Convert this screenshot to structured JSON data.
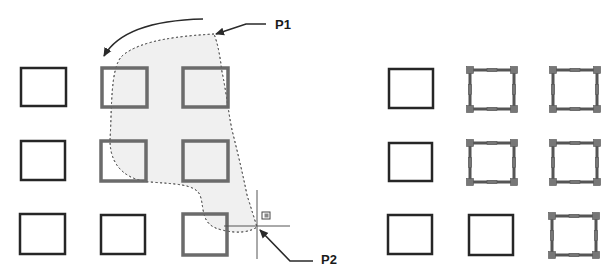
{
  "diagram": {
    "labels": {
      "p1": "P1",
      "p2": "P2"
    },
    "colors": {
      "object_stroke": "#262626",
      "selected_stroke": "#6b6b6b",
      "lasso_fill": "#f0f0f0",
      "lasso_stroke": "#555555",
      "grip_fill": "#777777",
      "arrow": "#2a2a2a"
    },
    "left_panel": {
      "description": "Lasso drawn from P1 to P2 counter-clockwise",
      "objects": [
        {
          "row": 1,
          "col": 1,
          "x": 21,
          "y": 68,
          "w": 45,
          "h": 38,
          "highlighted": false
        },
        {
          "row": 1,
          "col": 2,
          "x": 102,
          "y": 68,
          "w": 45,
          "h": 39,
          "highlighted": true
        },
        {
          "row": 1,
          "col": 3,
          "x": 183,
          "y": 68,
          "w": 45,
          "h": 39,
          "highlighted": true
        },
        {
          "row": 2,
          "col": 1,
          "x": 21,
          "y": 141,
          "w": 44,
          "h": 39,
          "highlighted": false
        },
        {
          "row": 2,
          "col": 2,
          "x": 101,
          "y": 141,
          "w": 45,
          "h": 40,
          "highlighted": true
        },
        {
          "row": 2,
          "col": 3,
          "x": 183,
          "y": 141,
          "w": 45,
          "h": 40,
          "highlighted": true
        },
        {
          "row": 3,
          "col": 1,
          "x": 20,
          "y": 214,
          "w": 45,
          "h": 40,
          "highlighted": false
        },
        {
          "row": 3,
          "col": 2,
          "x": 101,
          "y": 215,
          "w": 44,
          "h": 39,
          "highlighted": false
        },
        {
          "row": 3,
          "col": 3,
          "x": 183,
          "y": 214,
          "w": 44,
          "h": 41,
          "highlighted": true
        }
      ]
    },
    "right_panel": {
      "description": "Objects selected by lasso shown with grips",
      "objects": [
        {
          "row": 1,
          "col": 1,
          "x": 389,
          "y": 69,
          "w": 44,
          "h": 39,
          "selected": false
        },
        {
          "row": 1,
          "col": 2,
          "x": 470,
          "y": 70,
          "w": 44,
          "h": 39,
          "selected": true
        },
        {
          "row": 1,
          "col": 3,
          "x": 553,
          "y": 70,
          "w": 44,
          "h": 39,
          "selected": true
        },
        {
          "row": 2,
          "col": 1,
          "x": 389,
          "y": 143,
          "w": 43,
          "h": 38,
          "selected": false
        },
        {
          "row": 2,
          "col": 2,
          "x": 470,
          "y": 143,
          "w": 44,
          "h": 39,
          "selected": true
        },
        {
          "row": 2,
          "col": 3,
          "x": 553,
          "y": 143,
          "w": 44,
          "h": 39,
          "selected": true
        },
        {
          "row": 3,
          "col": 1,
          "x": 388,
          "y": 215,
          "w": 44,
          "h": 39,
          "selected": false
        },
        {
          "row": 3,
          "col": 2,
          "x": 469,
          "y": 215,
          "w": 44,
          "h": 40,
          "selected": false
        },
        {
          "row": 3,
          "col": 3,
          "x": 552,
          "y": 216,
          "w": 44,
          "h": 39,
          "selected": true
        }
      ]
    }
  }
}
